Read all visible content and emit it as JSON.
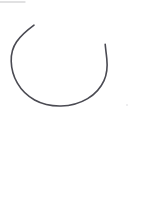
{
  "canvas": {
    "width": 145,
    "height": 208,
    "background_color": "#ffffff",
    "media": "scanned hand drawing",
    "content_description": "A single hand-drawn open arc resembling an incomplete circle or letter U, open at the top, occupying the upper portion of a white page"
  },
  "strokes": {
    "primary_arc": {
      "name": "open-arc",
      "shape": "incomplete circle open at top",
      "color": "#4a4a52",
      "stroke_width": 1.6,
      "linecap": "round",
      "fill": "none",
      "start_point": [
        34,
        25
      ],
      "end_point": [
        105,
        44
      ],
      "leftmost_x": 11,
      "rightmost_x": 110,
      "bottom_y": 105,
      "opening_width": 71,
      "path": "M 34.0 25.2 C 27.5 30.0 21.0 35.4 16.6 41.8 C 12.6 47.6 11.0 54.2 11.2 61.2 C 11.4 69.0 13.6 76.6 17.4 83.2 C 21.4 90.2 27.4 96.0 34.6 100.0 C 42.6 104.4 51.8 106.2 61.0 106.0 C 70.4 105.8 79.6 103.4 87.6 98.6 C 94.6 94.4 100.6 88.2 104.0 80.6 C 107.0 73.8 107.6 66.2 106.8 58.8 C 106.2 53.4 105.6 48.6 105.2 44.2"
    },
    "top_edge_smudge": {
      "name": "scan-edge-smudge",
      "color": "#b8b8bb",
      "stroke_width": 1.4,
      "opacity": 0.55,
      "x1": 0,
      "y1": 2,
      "x2": 25,
      "y2": 2
    },
    "stray_speck": {
      "name": "stray-speck",
      "color": "#dcdcdf",
      "opacity": 0.7,
      "cx": 127,
      "cy": 105,
      "r": 0.9
    }
  },
  "regions": {
    "lower_blank": {
      "name": "blank-lower-page",
      "label": "",
      "x": 0,
      "y": 115,
      "width": 145,
      "height": 93
    }
  }
}
